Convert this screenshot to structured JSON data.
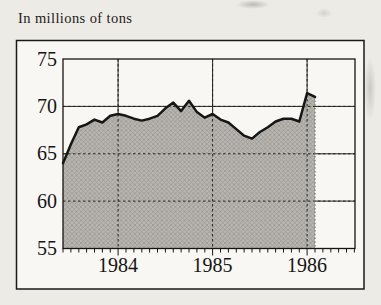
{
  "chart": {
    "title": "In millions of tons"
  },
  "chart_data": {
    "type": "area",
    "title": "In millions of tons",
    "unit": "millions of tons",
    "months": [
      "1983-06",
      "1983-07",
      "1983-08",
      "1983-09",
      "1983-10",
      "1983-11",
      "1983-12",
      "1984-01",
      "1984-02",
      "1984-03",
      "1984-04",
      "1984-05",
      "1984-06",
      "1984-07",
      "1984-08",
      "1984-09",
      "1984-10",
      "1984-11",
      "1984-12",
      "1985-01",
      "1985-02",
      "1985-03",
      "1985-04",
      "1985-05",
      "1985-06",
      "1985-07",
      "1985-08",
      "1985-09",
      "1985-10",
      "1985-11",
      "1985-12",
      "1986-01",
      "1986-02"
    ],
    "values": [
      64.0,
      66.0,
      67.8,
      68.1,
      68.6,
      68.3,
      69.0,
      69.2,
      69.0,
      68.7,
      68.5,
      68.7,
      69.0,
      69.8,
      70.4,
      69.5,
      70.6,
      69.4,
      68.8,
      69.2,
      68.6,
      68.3,
      67.6,
      66.9,
      66.6,
      67.3,
      67.8,
      68.4,
      68.7,
      68.7,
      68.4,
      71.4,
      71.0
    ],
    "y_ticks": [
      "75",
      "70",
      "65",
      "60",
      "55"
    ],
    "x_ticks": [
      "1984",
      "1985",
      "1986"
    ],
    "ylim": [
      55,
      75
    ],
    "grid": true,
    "legend": "none",
    "colors": {
      "fill_base": "#b9b6b1",
      "fill_hatch": "#96938d",
      "line": "#161616",
      "grid": "#23221f",
      "frame": "#1b1a18"
    }
  }
}
